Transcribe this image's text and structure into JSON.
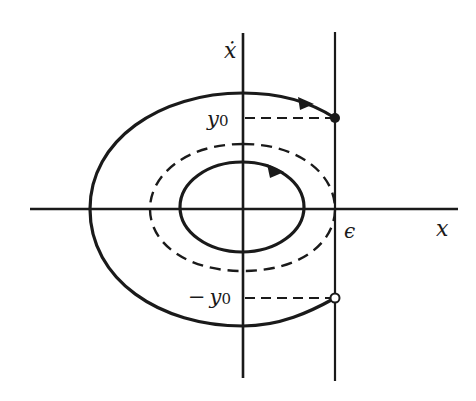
{
  "figure": {
    "type": "phase-plane",
    "labels": {
      "vertical_axis": "ẋ",
      "horizontal_axis": "x",
      "threshold": "ϵ",
      "y0_var": "y",
      "y0_sub": "0",
      "neg_y0_sign": "−",
      "neg_y0_var": "y",
      "neg_y0_sub": "0"
    },
    "colors": {
      "ink": "#1a1a1a",
      "background": "#ffffff"
    },
    "elements": {
      "outer_trajectory": "solid, from open point (ϵ, −y0) around left to filled point (ϵ, y0)",
      "dashed_orbit": "dashed closed curve touching line x = ϵ",
      "inner_orbit": "solid closed ellipse with clockwise arrow",
      "filled_point": "(ϵ, y0)",
      "open_point": "(ϵ, −y0)"
    }
  }
}
